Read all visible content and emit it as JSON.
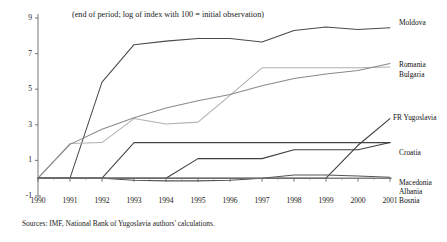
{
  "chart_data": {
    "type": "line",
    "title": "(end of period; log of index with 100 = initial observation)",
    "source": "Sources: IMF, National Bank of Yugoslavia authors' calculations.",
    "xlabel": "",
    "ylabel": "",
    "grid": false,
    "legend_position": "right-inline-labels",
    "x": [
      1990,
      1991,
      1992,
      1993,
      1994,
      1995,
      1996,
      1997,
      1998,
      1999,
      2000,
      2001
    ],
    "xlim": [
      1990,
      2001
    ],
    "ylim": [
      -1,
      9
    ],
    "yticks": [
      9,
      7,
      5,
      3,
      1,
      -1
    ],
    "xticks": [
      "1990",
      "1991",
      "1992",
      "1993",
      "1994",
      "1995",
      "1996",
      "1997",
      "1998",
      "1999",
      "2000",
      "2001"
    ],
    "series": [
      {
        "name": "Moldova",
        "color": "#4a4a4a",
        "values": [
          0.0,
          0.0,
          5.4,
          7.5,
          7.7,
          7.85,
          7.85,
          7.65,
          8.3,
          8.5,
          8.35,
          8.45
        ]
      },
      {
        "name": "Romania",
        "color": "#b0b0b0",
        "values": [
          0.0,
          1.95,
          2.0,
          3.35,
          3.05,
          3.15,
          4.65,
          6.2,
          6.2,
          6.2,
          6.2,
          6.25
        ]
      },
      {
        "name": "Bulgaria",
        "color": "#8a8a8a",
        "values": [
          0.0,
          1.9,
          2.75,
          3.4,
          3.95,
          4.35,
          4.7,
          5.2,
          5.6,
          5.85,
          6.05,
          6.45
        ]
      },
      {
        "name": "FR Yugoslavia",
        "color": "#3a3a3a",
        "values": [
          0.0,
          0.0,
          0.0,
          0.0,
          0.0,
          0.0,
          0.0,
          0.0,
          0.0,
          0.0,
          1.85,
          3.35
        ]
      },
      {
        "name": "Croatia",
        "color": "#454545",
        "values": [
          0.0,
          0.0,
          0.0,
          2.0,
          2.0,
          2.0,
          2.0,
          2.0,
          2.0,
          2.0,
          2.0,
          2.0
        ]
      },
      {
        "name": "Macedonia",
        "color": "#3f3f3f",
        "values": [
          0.0,
          0.0,
          0.0,
          0.0,
          0.0,
          1.1,
          1.1,
          1.1,
          1.6,
          1.6,
          1.6,
          2.0
        ]
      },
      {
        "name": "Albania",
        "color": "#555555",
        "values": [
          0.0,
          0.0,
          0.0,
          -0.12,
          -0.15,
          -0.15,
          -0.12,
          0.0,
          0.18,
          0.18,
          0.12,
          0.05
        ]
      },
      {
        "name": "Bosnia",
        "color": "#777777",
        "values": [
          0.0,
          0.0,
          0.0,
          0.0,
          0.0,
          0.0,
          0.0,
          0.0,
          0.0,
          0.0,
          0.0,
          0.0
        ]
      }
    ],
    "series_labels": [
      {
        "name": "Moldova",
        "top": 18,
        "left": 399
      },
      {
        "name": "Romania",
        "top": 60,
        "left": 399
      },
      {
        "name": "Bulgaria",
        "top": 70,
        "left": 399
      },
      {
        "name": "FR Yugoslavia",
        "top": 113,
        "left": 393
      },
      {
        "name": "Croatia",
        "top": 148,
        "left": 399
      },
      {
        "name": "Macedonia",
        "top": 178,
        "left": 399
      },
      {
        "name": "Albania",
        "top": 187,
        "left": 399
      },
      {
        "name": "Bosnia",
        "top": 196,
        "left": 399
      }
    ]
  }
}
